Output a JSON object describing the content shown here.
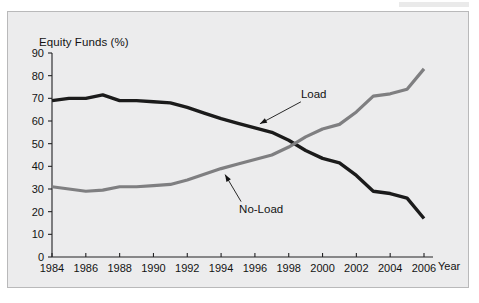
{
  "figure": {
    "background_color": "#ececed",
    "border_color": "#b9b9ba"
  },
  "chart_data": {
    "type": "line",
    "title": "",
    "subtitle": "",
    "xlabel": "Year",
    "ylabel": "Equity Funds (%)",
    "ylim": [
      0,
      90
    ],
    "xlim": [
      1984,
      2006
    ],
    "ytick_labels": [
      "0",
      "10",
      "20",
      "30",
      "40",
      "50",
      "60",
      "70",
      "80",
      "90"
    ],
    "ytick_values": [
      0,
      10,
      20,
      30,
      40,
      50,
      60,
      70,
      80,
      90
    ],
    "xtick_labels": [
      "1984",
      "1986",
      "1988",
      "1990",
      "1992",
      "1994",
      "1996",
      "1998",
      "2000",
      "2002",
      "2004",
      "2006"
    ],
    "xtick_values": [
      1984,
      1986,
      1988,
      1990,
      1992,
      1994,
      1996,
      1998,
      2000,
      2002,
      2004,
      2006
    ],
    "grid": false,
    "legend_position": "inline-annotations",
    "x": [
      1984,
      1985,
      1986,
      1987,
      1988,
      1989,
      1990,
      1991,
      1992,
      1993,
      1994,
      1995,
      1996,
      1997,
      1998,
      1999,
      2000,
      2001,
      2002,
      2003,
      2004,
      2005,
      2006
    ],
    "series": [
      {
        "name": "Load",
        "color": "#1b1b1b",
        "values": [
          69,
          70,
          70,
          71.5,
          69,
          69,
          68.5,
          68,
          66,
          63.5,
          61,
          59,
          57,
          55,
          51.5,
          47,
          43.5,
          41.5,
          36,
          29,
          28,
          26,
          17
        ]
      },
      {
        "name": "No-Load",
        "color": "#7f7f81",
        "values": [
          31,
          30,
          29,
          29.5,
          31,
          31,
          31.5,
          32,
          34,
          36.5,
          39,
          41,
          43,
          45,
          48.5,
          53,
          56.5,
          58.5,
          64,
          71,
          72,
          74,
          83
        ]
      }
    ],
    "annotations": [
      {
        "text": "Load",
        "target_series": "Load",
        "target_year": 1996,
        "target_value": 57
      },
      {
        "text": "No-Load",
        "target_series": "No-Load",
        "target_year": 1994,
        "target_value": 39
      }
    ]
  }
}
